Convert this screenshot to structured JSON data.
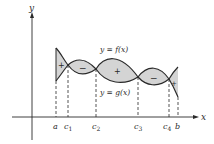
{
  "figure": {
    "axes": {
      "x_label": "x",
      "y_label": "y"
    },
    "curves": {
      "f_label": "y = f(x)",
      "g_label": "y = g(x)"
    },
    "ticks": [
      {
        "label": "a",
        "sub": ""
      },
      {
        "label": "c",
        "sub": "1"
      },
      {
        "label": "c",
        "sub": "2"
      },
      {
        "label": "c",
        "sub": "3"
      },
      {
        "label": "c",
        "sub": "4"
      },
      {
        "label": "b",
        "sub": ""
      }
    ],
    "region_signs": [
      "+",
      "−",
      "+",
      "−",
      "+"
    ],
    "colors": {
      "line": "#2a2a2a",
      "fill": "#d4d4d4",
      "background": "#ffffff"
    }
  }
}
